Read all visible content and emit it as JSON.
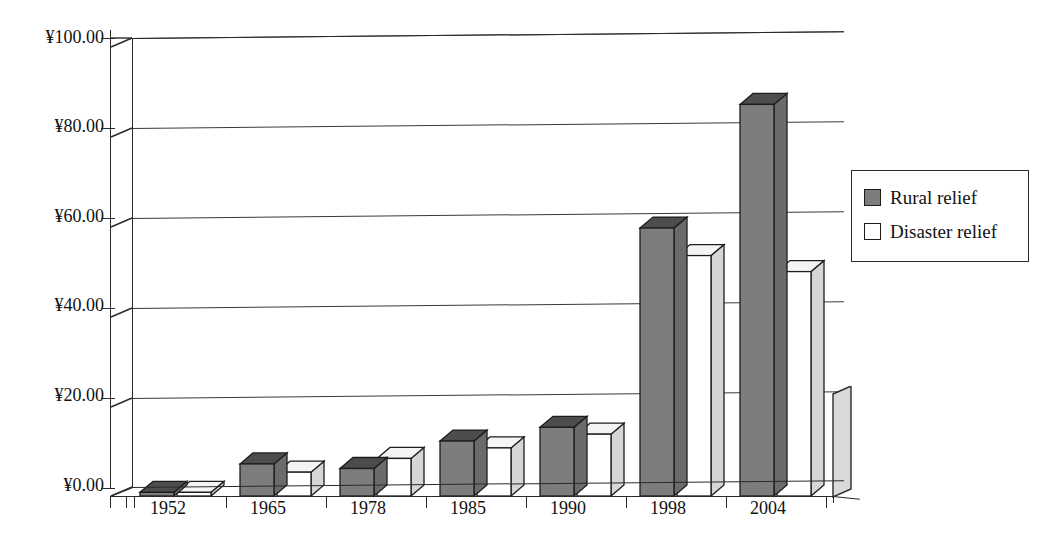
{
  "chart_data": {
    "type": "bar",
    "title": "",
    "subtitle": "",
    "xlabel": "",
    "ylabel": "",
    "categories": [
      "1952",
      "1965",
      "1978",
      "1985",
      "1990",
      "1998",
      "2004"
    ],
    "series": [
      {
        "name": "Rural relief",
        "color": "#7d7d7d",
        "values": [
          0.8,
          7.0,
          6.0,
          12.0,
          15.0,
          58.5,
          85.5
        ]
      },
      {
        "name": "Disaster relief",
        "color": "#ffffff",
        "values": [
          0.8,
          5.2,
          8.2,
          10.5,
          13.5,
          52.5,
          49.0
        ]
      }
    ],
    "ylim": [
      0,
      100
    ],
    "ytick_values": [
      0,
      20,
      40,
      60,
      80,
      100
    ],
    "ytick_labels": [
      "¥0.00",
      "¥20.00",
      "¥40.00",
      "¥60.00",
      "¥80.00",
      "¥100.00"
    ],
    "currency_symbol": "¥",
    "grid": true,
    "grid_axis": "y",
    "legend_position": "right",
    "style": "3d-clustered-column",
    "background": "#ffffff",
    "axis_color": "#2a2a2a",
    "grid_color": "#3a3a3a"
  },
  "legend": {
    "items": [
      {
        "label": "Rural relief",
        "swatch": "rural"
      },
      {
        "label": "Disaster relief",
        "swatch": "disaster"
      }
    ]
  }
}
